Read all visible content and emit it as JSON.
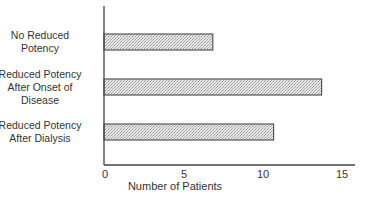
{
  "chart_data": {
    "type": "bar",
    "orientation": "horizontal",
    "title": "",
    "xlabel": "Number of Patients",
    "ylabel": "",
    "categories": [
      "No Reduced Potency",
      "Reduced Potency After Onset of Disease",
      "Reduced Potency After Dialysis"
    ],
    "category_label_lines": [
      [
        "No Reduced",
        "Potency"
      ],
      [
        "Reduced Potency",
        "After Onset of",
        "Disease"
      ],
      [
        "Reduced Potency",
        "After Dialysis"
      ]
    ],
    "values": [
      6.8,
      13.6,
      10.6
    ],
    "xlim": [
      0,
      15
    ],
    "xticks": [
      0,
      5,
      10,
      15
    ],
    "xtick_labels": [
      "0",
      "5",
      "10",
      "15"
    ],
    "grid": false,
    "legend": null,
    "bar_fill": "stippled light gray",
    "bar_edge_color": "#555555"
  }
}
